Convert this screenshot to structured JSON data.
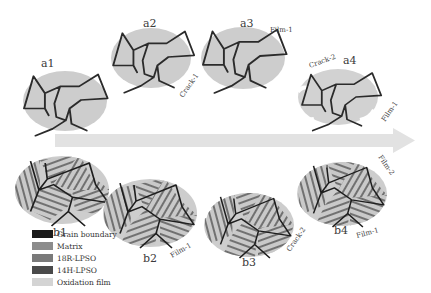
{
  "figure": {
    "stages_top": [
      {
        "id": "a1",
        "label": "a1"
      },
      {
        "id": "a2",
        "label": "a2"
      },
      {
        "id": "a3",
        "label": "a3"
      },
      {
        "id": "a4",
        "label": "a4"
      }
    ],
    "stages_bottom": [
      {
        "id": "b1",
        "label": "b1"
      },
      {
        "id": "b2",
        "label": "b2"
      },
      {
        "id": "b3",
        "label": "b3"
      },
      {
        "id": "b4",
        "label": "b4"
      }
    ],
    "annotations": {
      "a2_crack": "Crack-1",
      "a3_film": "Film-1",
      "a4_crack": "Crack-2",
      "a4_film": "Film-1",
      "b2_film": "Film-1",
      "b3_crack": "Crack-2",
      "b4_film1": "Film-1",
      "b4_film2": "Film-2"
    },
    "arrow": {
      "direction": "right",
      "meaning": "time / oxidation progression"
    }
  },
  "legend": {
    "items": [
      {
        "label": "Grain boundary",
        "color": "#1a1a1a"
      },
      {
        "label": "Matrix",
        "color": "#8c8c8c"
      },
      {
        "label": "18R-LPSO",
        "color": "#7a7a7a"
      },
      {
        "label": "14H-LPSO",
        "color": "#4a4a4a"
      },
      {
        "label": "Oxidation film",
        "color": "#d4d4d4"
      }
    ]
  },
  "colors": {
    "grain_fill": "#cfcfcf",
    "grain_boundary": "#2b2b2b",
    "lpso_lines": "#5a5a5a",
    "arrow": "#e2e2e2",
    "film": "#e8e8e8"
  }
}
